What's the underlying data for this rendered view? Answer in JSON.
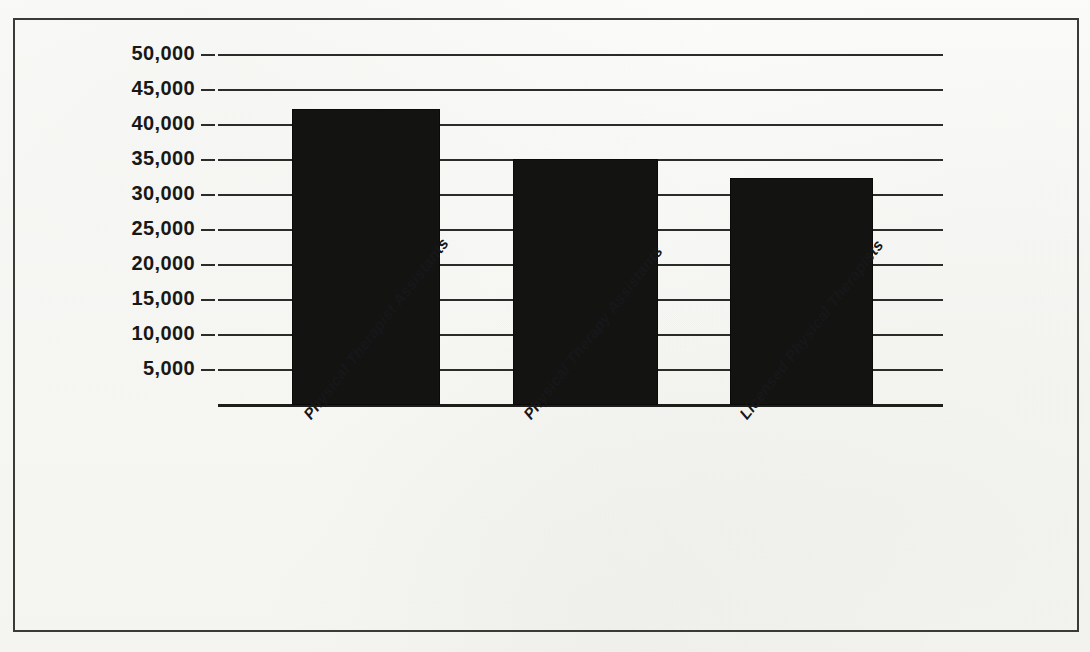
{
  "chart_data": {
    "type": "bar",
    "title": "",
    "subtitle": "",
    "xlabel": "",
    "ylabel": "",
    "categories": [
      "Physical Therapist Assistants",
      "Physical Therapy Assistants",
      "Licensed Physical Therapists"
    ],
    "values": [
      42300,
      35200,
      32500
    ],
    "ylim": [
      0,
      50000
    ],
    "ytick_labels": [
      "50,000",
      "45,000",
      "40,000",
      "35,000",
      "30,000",
      "25,000",
      "20,000",
      "15,000",
      "10,000",
      "5,000"
    ],
    "ytick_values": [
      50000,
      45000,
      40000,
      35000,
      30000,
      25000,
      20000,
      15000,
      10000,
      5000
    ],
    "grid": true,
    "legend": false,
    "legend_position": "none",
    "bar_color": "#131311",
    "grid_color": "#2b2b29",
    "background_color": "#f8f8f6",
    "x_tick_rotation_degrees": -52
  },
  "figure": {
    "border_color": "#3a3a38"
  }
}
